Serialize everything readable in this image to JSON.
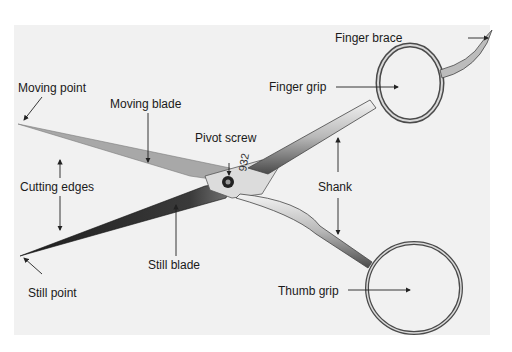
{
  "diagram": {
    "engraving": "932",
    "labels": {
      "finger_brace": "Finger brace",
      "finger_grip": "Finger grip",
      "moving_point": "Moving point",
      "moving_blade": "Moving blade",
      "pivot_screw": "Pivot screw",
      "cutting_edges": "Cutting edges",
      "shank": "Shank",
      "still_blade": "Still blade",
      "still_point": "Still point",
      "thumb_grip": "Thumb grip"
    }
  },
  "colors": {
    "background": "#f1f1f1",
    "steel_light": "#d8d8d8",
    "steel_dark": "#3a3a3a",
    "moving_blade": "#a8a8a8",
    "still_blade": "#2a2a2a",
    "label_text": "#1a1a1a"
  }
}
